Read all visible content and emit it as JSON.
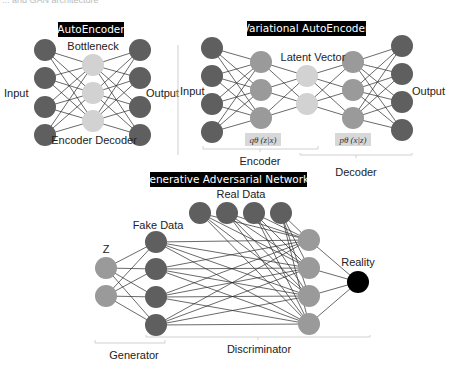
{
  "top_cut_text": "... and GAN architecture",
  "autoencoder": {
    "title": "AutoEncoder",
    "labels": {
      "input": "Input",
      "output": "Output",
      "bottleneck": "Bottleneck",
      "encoder_decoder": "Encoder Decoder"
    },
    "layers": [
      {
        "role": "input",
        "x": 45,
        "ys": [
          50,
          78,
          107,
          135
        ],
        "color": "#5f5f5f"
      },
      {
        "role": "bottleneck",
        "x": 93,
        "ys": [
          65,
          93,
          121
        ],
        "color": "#d2d2d2"
      },
      {
        "role": "output",
        "x": 140,
        "ys": [
          50,
          78,
          107,
          135
        ],
        "color": "#5f5f5f"
      }
    ]
  },
  "vae": {
    "title": "Variational AutoEncoder",
    "labels": {
      "input": "Input",
      "output": "Output",
      "latent": "Latent Vector",
      "encoder": "Encoder",
      "decoder": "Decoder"
    },
    "formulas": {
      "encoder": "qθ (z|x)",
      "decoder": "pθ (x|z)"
    },
    "layers": [
      {
        "role": "input",
        "x": 212,
        "ys": [
          48,
          76,
          104,
          132
        ],
        "color": "#5f5f5f"
      },
      {
        "role": "enc-hidden",
        "x": 261,
        "ys": [
          62,
          90,
          118
        ],
        "color": "#9a9a9a"
      },
      {
        "role": "latent",
        "x": 307,
        "ys": [
          76,
          104
        ],
        "color": "#d2d2d2"
      },
      {
        "role": "dec-hidden",
        "x": 353,
        "ys": [
          62,
          90,
          118
        ],
        "color": "#9a9a9a"
      },
      {
        "role": "output",
        "x": 402,
        "ys": [
          46,
          74,
          102,
          130
        ],
        "color": "#5f5f5f"
      }
    ]
  },
  "gan": {
    "title": "Generative Adversarial Networks",
    "labels": {
      "z": "Z",
      "fake": "Fake Data",
      "real": "Real Data",
      "reality": "Reality",
      "generator": "Generator",
      "discriminator": "Discriminator"
    },
    "z": {
      "x": 106,
      "ys": [
        268,
        296
      ],
      "color": "#9a9a9a"
    },
    "fake": {
      "x": 156,
      "ys": [
        242,
        269,
        297,
        325
      ],
      "color": "#5f5f5f"
    },
    "real": {
      "xs": [
        200,
        227,
        254,
        281
      ],
      "y": 213,
      "color": "#5f5f5f"
    },
    "disc": {
      "x": 309,
      "ys": [
        240,
        268,
        296,
        324
      ],
      "color": "#9a9a9a"
    },
    "reality": {
      "x": 358,
      "y": 282,
      "color": "#000000"
    }
  }
}
